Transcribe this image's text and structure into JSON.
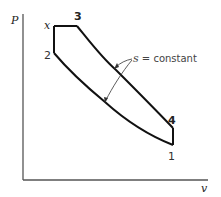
{
  "diagram": {
    "type": "thermodynamic P-v diagram (dual cycle)",
    "axes": {
      "y_label": "P",
      "x_label": "v"
    },
    "points": {
      "x": "x",
      "p1": "1",
      "p2": "2",
      "p3": "3",
      "p4": "4"
    },
    "annotation": {
      "s_symbol": "s",
      "rest": " = constant"
    },
    "colors": {
      "line": "#111111",
      "axis": "#555555",
      "background": "#ffffff"
    }
  }
}
